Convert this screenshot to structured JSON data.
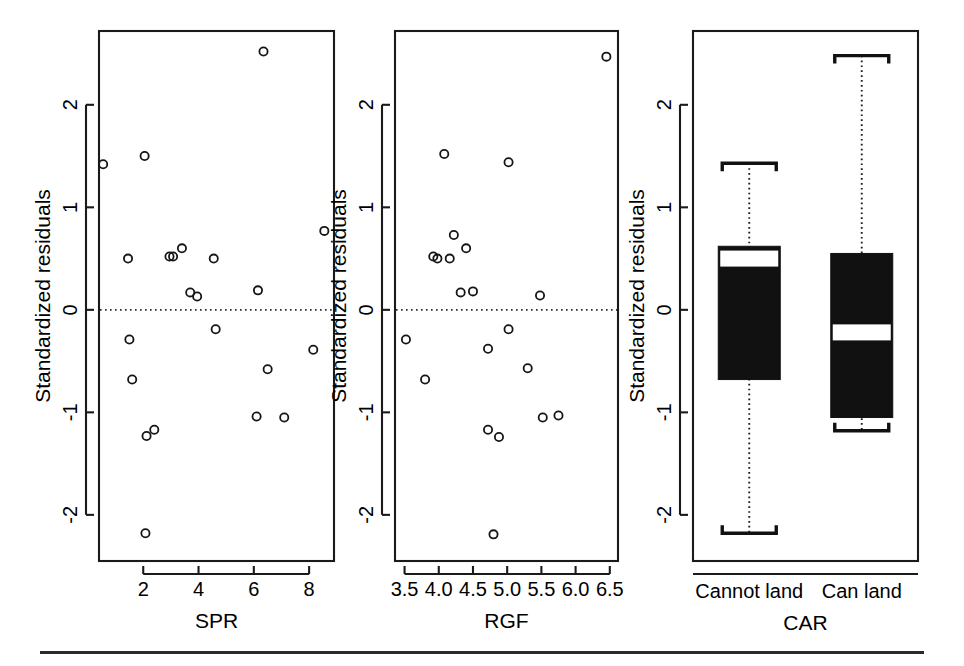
{
  "figure": {
    "width": 964,
    "height": 666,
    "background": "#ffffff",
    "ink_color": "#111111",
    "panel_count": 3,
    "shared_ylabel": "Standardized residuals",
    "bottom_rule": true
  },
  "chart_data": [
    {
      "type": "scatter",
      "title": "",
      "xlabel": "SPR",
      "ylabel": "Standardized residuals",
      "xticks": [
        2,
        4,
        6,
        8
      ],
      "yticks": [
        -2,
        -1,
        0,
        1,
        2
      ],
      "xlim": [
        0.4,
        8.9
      ],
      "ylim": [
        -2.45,
        2.72
      ],
      "grid": false,
      "reference_line": {
        "orientation": "horizontal",
        "y": 0,
        "style": "dotted"
      },
      "points": [
        {
          "x": 0.55,
          "y": 1.42
        },
        {
          "x": 2.05,
          "y": 1.5
        },
        {
          "x": 6.35,
          "y": 2.52
        },
        {
          "x": 8.55,
          "y": 0.77
        },
        {
          "x": 1.45,
          "y": 0.5
        },
        {
          "x": 2.95,
          "y": 0.52
        },
        {
          "x": 3.08,
          "y": 0.52
        },
        {
          "x": 3.4,
          "y": 0.6
        },
        {
          "x": 4.55,
          "y": 0.5
        },
        {
          "x": 3.7,
          "y": 0.17
        },
        {
          "x": 3.95,
          "y": 0.13
        },
        {
          "x": 6.15,
          "y": 0.19
        },
        {
          "x": 4.62,
          "y": -0.19
        },
        {
          "x": 1.5,
          "y": -0.29
        },
        {
          "x": 8.15,
          "y": -0.39
        },
        {
          "x": 1.6,
          "y": -0.68
        },
        {
          "x": 6.5,
          "y": -0.58
        },
        {
          "x": 6.1,
          "y": -1.04
        },
        {
          "x": 7.1,
          "y": -1.05
        },
        {
          "x": 2.12,
          "y": -1.23
        },
        {
          "x": 2.4,
          "y": -1.17
        },
        {
          "x": 2.08,
          "y": -2.18
        }
      ]
    },
    {
      "type": "scatter",
      "title": "",
      "xlabel": "RGF",
      "ylabel": "Standardized residuals",
      "xticks": [
        3.5,
        4.0,
        4.5,
        5.0,
        5.5,
        6.0,
        6.5
      ],
      "xtick_labels": [
        "3.5",
        "4.0",
        "4.5",
        "5.0",
        "5.5",
        "6.0",
        "6.5"
      ],
      "yticks": [
        -2,
        -1,
        0,
        1,
        2
      ],
      "xlim": [
        3.36,
        6.62
      ],
      "ylim": [
        -2.45,
        2.72
      ],
      "grid": false,
      "reference_line": {
        "orientation": "horizontal",
        "y": 0,
        "style": "dotted"
      },
      "points": [
        {
          "x": 6.45,
          "y": 2.47
        },
        {
          "x": 4.08,
          "y": 1.52
        },
        {
          "x": 5.02,
          "y": 1.44
        },
        {
          "x": 4.22,
          "y": 0.73
        },
        {
          "x": 4.4,
          "y": 0.6
        },
        {
          "x": 3.92,
          "y": 0.52
        },
        {
          "x": 3.98,
          "y": 0.5
        },
        {
          "x": 4.16,
          "y": 0.5
        },
        {
          "x": 4.32,
          "y": 0.17
        },
        {
          "x": 4.5,
          "y": 0.18
        },
        {
          "x": 5.48,
          "y": 0.14
        },
        {
          "x": 5.02,
          "y": -0.19
        },
        {
          "x": 3.52,
          "y": -0.29
        },
        {
          "x": 4.72,
          "y": -0.38
        },
        {
          "x": 5.3,
          "y": -0.57
        },
        {
          "x": 3.8,
          "y": -0.68
        },
        {
          "x": 5.52,
          "y": -1.05
        },
        {
          "x": 5.75,
          "y": -1.03
        },
        {
          "x": 4.72,
          "y": -1.17
        },
        {
          "x": 4.88,
          "y": -1.24
        },
        {
          "x": 4.8,
          "y": -2.19
        }
      ]
    },
    {
      "type": "boxplot",
      "title": "",
      "xlabel": "CAR",
      "ylabel": "Standardized residuals",
      "yticks": [
        -2,
        -1,
        0,
        1,
        2
      ],
      "ylim": [
        -2.45,
        2.72
      ],
      "grid": false,
      "box_fill": "#111111",
      "median_color": "#ffffff",
      "categories": [
        "Cannot land",
        "Can land"
      ],
      "boxes": [
        {
          "label": "Cannot land",
          "lower_whisker": -2.18,
          "q1": -0.68,
          "median": 0.5,
          "q3": 0.62,
          "upper_whisker": 1.43
        },
        {
          "label": "Can land",
          "lower_whisker": -1.18,
          "q1": -1.05,
          "median": -0.22,
          "q3": 0.55,
          "upper_whisker": 2.48
        }
      ]
    }
  ]
}
